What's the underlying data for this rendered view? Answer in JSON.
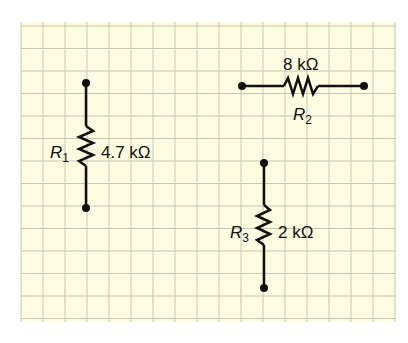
{
  "diagram": {
    "background": "#fdfbe0",
    "grid_color": "#c9c6b6",
    "resistors": [
      {
        "name": "R1",
        "label": "R",
        "sub": "1",
        "value": "4.7 kΩ"
      },
      {
        "name": "R2",
        "label": "R",
        "sub": "2",
        "value": "8 kΩ"
      },
      {
        "name": "R3",
        "label": "R",
        "sub": "3",
        "value": "2 kΩ"
      }
    ]
  }
}
